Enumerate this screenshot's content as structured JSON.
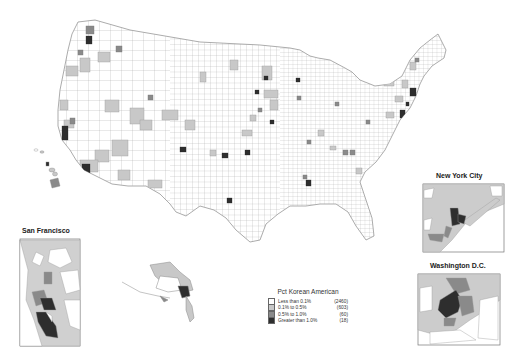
{
  "legend": {
    "title": "Pct Korean American",
    "items": [
      {
        "label": "Less than 0.1%",
        "count": "(2460)",
        "color": "#ffffff"
      },
      {
        "label": "0.1% to 0.5%",
        "count": "(603)",
        "color": "#c8c8c8"
      },
      {
        "label": "0.5% to 1.0%",
        "count": "(60)",
        "color": "#8a8a8a"
      },
      {
        "label": "Greater than 1.0%",
        "count": "(18)",
        "color": "#2e2e2e"
      }
    ]
  },
  "insets": {
    "san_francisco": {
      "title": "San Francisco"
    },
    "new_york": {
      "title": "New York City"
    },
    "washington": {
      "title": "Washington D.C."
    }
  },
  "colors": {
    "border": "#9a9a9a",
    "class0": "#ffffff",
    "class1": "#c8c8c8",
    "class2": "#8a8a8a",
    "class3": "#2e2e2e"
  }
}
